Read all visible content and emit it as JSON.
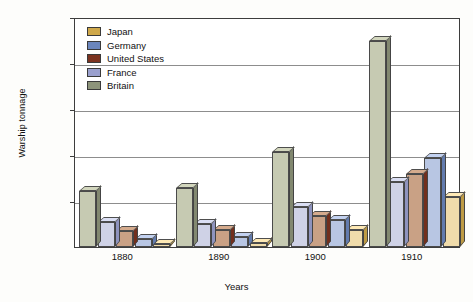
{
  "chart_data": {
    "type": "bar",
    "title": "",
    "subtitle": "",
    "xlabel": "Years",
    "ylabel": "Warship tonnage",
    "categories": [
      "1880",
      "1890",
      "1900",
      "1910"
    ],
    "ylim": [
      0,
      2500000
    ],
    "ytick_labels": [
      "2,500,000",
      "2,000,000",
      "1,500,000",
      "1,000,000",
      "500,000"
    ],
    "ytick_values": [
      2500000,
      2000000,
      1500000,
      1000000,
      500000
    ],
    "grid": true,
    "legend_position": "top-left",
    "bar_order_in_group": [
      "Britain",
      "France",
      "United States",
      "Germany",
      "Japan"
    ],
    "series": [
      {
        "name": "Japan",
        "color": "#cfa84b",
        "face_color": "#f0dcab",
        "values": [
          30000,
          40000,
          185000,
          540000
        ]
      },
      {
        "name": "Germany",
        "color": "#6b86bd",
        "face_color": "#b8c6e3",
        "values": [
          90000,
          110000,
          290000,
          965000
        ]
      },
      {
        "name": "United States",
        "color": "#7c3320",
        "face_color": "#c9a185",
        "values": [
          170000,
          180000,
          340000,
          790000
        ]
      },
      {
        "name": "France",
        "color": "#9aa0ce",
        "face_color": "#cfd2e6",
        "values": [
          270000,
          255000,
          440000,
          705000
        ]
      },
      {
        "name": "Britain",
        "color": "#8d947a",
        "face_color": "#c6cab2",
        "values": [
          605000,
          640000,
          1030000,
          2235000
        ]
      }
    ]
  },
  "legend": {
    "items": [
      {
        "label": "Japan",
        "color": "#cfa84b"
      },
      {
        "label": "Germany",
        "color": "#6b86bd"
      },
      {
        "label": "United States",
        "color": "#7c3320"
      },
      {
        "label": "France",
        "color": "#9aa0ce"
      },
      {
        "label": "Britain",
        "color": "#8d947a"
      }
    ]
  },
  "axes": {
    "y_title": "Warship tonnage",
    "x_title": "Years",
    "y_ticks": [
      {
        "label": "2,500,000"
      },
      {
        "label": "2,000,000"
      },
      {
        "label": "1,500,000"
      },
      {
        "label": "1,000,000"
      },
      {
        "label": "500,000"
      }
    ],
    "x_ticks": [
      {
        "label": "1880"
      },
      {
        "label": "1890"
      },
      {
        "label": "1900"
      },
      {
        "label": "1910"
      }
    ]
  }
}
